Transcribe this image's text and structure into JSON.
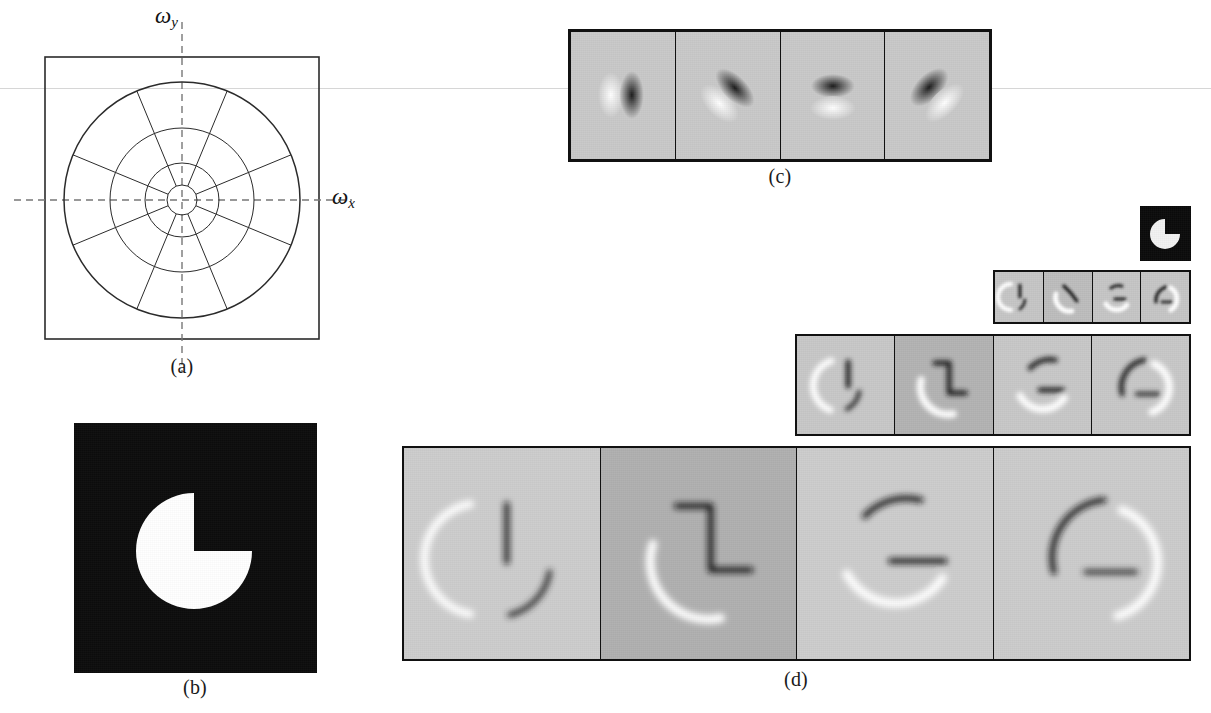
{
  "figure": {
    "background_color": "#ffffff",
    "width": 1211,
    "height": 713
  },
  "panel_a": {
    "caption": "(a)",
    "axis_x_label": "ω",
    "axis_x_sub": "x",
    "axis_y_label": "ω",
    "axis_y_sub": "y",
    "description": "polar frequency-domain tiling: square outer boundary with four concentric circles and eight radial spokes",
    "num_rings": 4,
    "num_orientations": 8,
    "spoke_angles_deg": [
      22.5,
      67.5,
      112.5,
      157.5,
      202.5,
      247.5,
      292.5,
      337.5
    ],
    "ring_radii_px": [
      15,
      37,
      72,
      118
    ],
    "square": {
      "x": 45,
      "y": 57,
      "w": 274,
      "h": 282
    },
    "circle_center": {
      "x": 182,
      "y": 200
    },
    "line_color": "#2b2b2b",
    "dash_color": "#777777"
  },
  "panel_b": {
    "caption": "(b)",
    "description": "binary pac-man image: white disk on black field with a 90-degree wedge removed from the upper-right quadrant",
    "background_color": "#0d0d0d",
    "shape_color": "#ffffff",
    "wedge_start_deg": 0,
    "wedge_end_deg": 90,
    "box": {
      "x": 74,
      "y": 423,
      "w": 243,
      "h": 250
    }
  },
  "panel_c": {
    "caption": "(c)",
    "description": "four oriented bandpass basis filters (steerable pyramid kernels) shown as grayscale impulse responses",
    "tile_background": "#c9c9c9",
    "border_color": "#111111",
    "box": {
      "x": 568,
      "y": 29,
      "w": 424,
      "h": 133
    },
    "tiles": [
      {
        "orientation_deg": 0,
        "label": "filter-0deg"
      },
      {
        "orientation_deg": 45,
        "label": "filter-45deg"
      },
      {
        "orientation_deg": 90,
        "label": "filter-90deg"
      },
      {
        "orientation_deg": 135,
        "label": "filter-135deg"
      }
    ]
  },
  "panel_d": {
    "caption": "(d)",
    "description": "multi-scale steerable pyramid: oriented subbands of the pac-man at four scales, coarsest (small) at top to finest (large) at bottom",
    "border_color": "#111111",
    "thumbnail": {
      "label": "lowpass-residual-thumbnail",
      "box": {
        "x": 1140,
        "y": 206,
        "w": 51,
        "h": 55
      },
      "background_color": "#0b0b0b",
      "shape_color": "#f2f2f2"
    },
    "rows": [
      {
        "scale": 1,
        "label": "pyramid-row-scale-1",
        "box": {
          "x": 993,
          "y": 270,
          "w": 198,
          "h": 54
        },
        "tiles": [
          {
            "orientation_deg": 0,
            "background": "#c6c6c6"
          },
          {
            "orientation_deg": 45,
            "background": "#bdbdbd"
          },
          {
            "orientation_deg": 90,
            "background": "#c6c6c6"
          },
          {
            "orientation_deg": 135,
            "background": "#c6c6c6"
          }
        ]
      },
      {
        "scale": 2,
        "label": "pyramid-row-scale-2",
        "box": {
          "x": 795,
          "y": 334,
          "w": 396,
          "h": 102
        },
        "tiles": [
          {
            "orientation_deg": 0,
            "background": "#c8c8c8"
          },
          {
            "orientation_deg": 45,
            "background": "#b3b3b3"
          },
          {
            "orientation_deg": 90,
            "background": "#c8c8c8"
          },
          {
            "orientation_deg": 135,
            "background": "#c8c8c8"
          }
        ]
      },
      {
        "scale": 3,
        "label": "pyramid-row-scale-3",
        "box": {
          "x": 402,
          "y": 446,
          "w": 789,
          "h": 215
        },
        "tiles": [
          {
            "orientation_deg": 0,
            "background": "#cdcdcd"
          },
          {
            "orientation_deg": 45,
            "background": "#b0b0b0"
          },
          {
            "orientation_deg": 90,
            "background": "#cdcdcd"
          },
          {
            "orientation_deg": 135,
            "background": "#cccccc"
          }
        ]
      }
    ]
  }
}
